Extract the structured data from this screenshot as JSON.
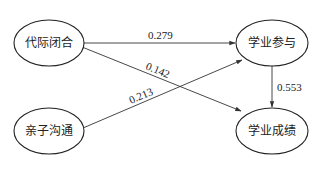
{
  "diagram": {
    "type": "path-model",
    "nodes": [
      {
        "id": "intergenerational_closure",
        "label": "代际闭合"
      },
      {
        "id": "academic_engagement",
        "label": "学业参与"
      },
      {
        "id": "parent_child_communication",
        "label": "亲子沟通"
      },
      {
        "id": "academic_achievement",
        "label": "学业成绩"
      }
    ],
    "edges": [
      {
        "from": "代际闭合",
        "to": "学业参与",
        "label": "0.279"
      },
      {
        "from": "代际闭合",
        "to": "学业成绩",
        "label": "0.142"
      },
      {
        "from": "亲子沟通",
        "to": "学业参与",
        "label": "0.213"
      },
      {
        "from": "学业参与",
        "to": "学业成绩",
        "label": "0.553"
      }
    ]
  }
}
